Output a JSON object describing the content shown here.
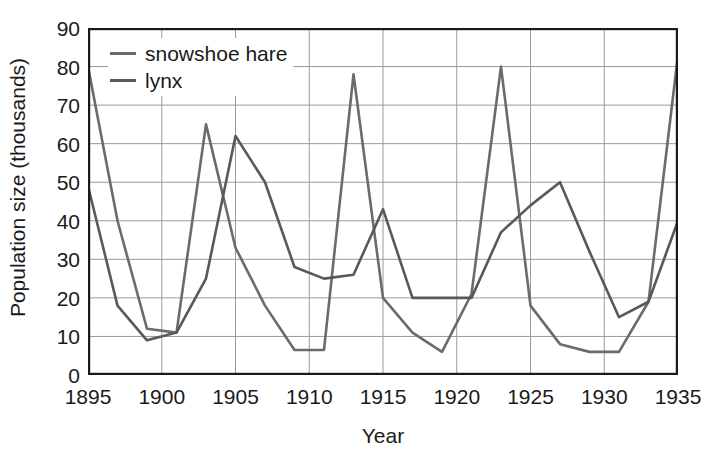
{
  "chart_data": {
    "type": "line",
    "title": "",
    "xlabel": "Year",
    "ylabel": "Population size (thousands)",
    "xlim": [
      1895,
      1935
    ],
    "ylim": [
      0,
      90
    ],
    "grid": true,
    "legend_position": "top-left",
    "xticks": [
      1895,
      1900,
      1905,
      1910,
      1915,
      1920,
      1925,
      1930,
      1935
    ],
    "xtick_labels": [
      "1895",
      "1900",
      "1905",
      "1910",
      "1915",
      "1920",
      "1925",
      "1930",
      "1935"
    ],
    "yticks": [
      0,
      10,
      20,
      30,
      40,
      50,
      60,
      70,
      80,
      90
    ],
    "ytick_labels": [
      "0",
      "10",
      "20",
      "30",
      "40",
      "50",
      "60",
      "70",
      "80",
      "90"
    ],
    "x": [
      1895,
      1897,
      1899,
      1901,
      1903,
      1905,
      1907,
      1909,
      1911,
      1913,
      1915,
      1917,
      1919,
      1921,
      1923,
      1925,
      1927,
      1929,
      1931,
      1933,
      1935
    ],
    "series": [
      {
        "name": "snowshoe hare",
        "color": "#6b6b6b",
        "values": [
          80,
          40,
          12,
          11,
          65,
          33,
          18,
          6.5,
          6.5,
          78,
          20,
          11,
          6,
          21,
          80,
          18,
          8,
          6,
          6,
          19,
          83
        ]
      },
      {
        "name": "lynx",
        "color": "#595959",
        "values": [
          49,
          18,
          9,
          11,
          25,
          62,
          50,
          28,
          25,
          26,
          43,
          20,
          20,
          20,
          37,
          44,
          50,
          32,
          15,
          19,
          40
        ]
      }
    ]
  },
  "legend": {
    "items": [
      {
        "label": "snowshoe hare",
        "color": "#6b6b6b"
      },
      {
        "label": "lynx",
        "color": "#595959"
      }
    ]
  },
  "axes": {
    "x_title": "Year",
    "y_title": "Population size (thousands)"
  }
}
